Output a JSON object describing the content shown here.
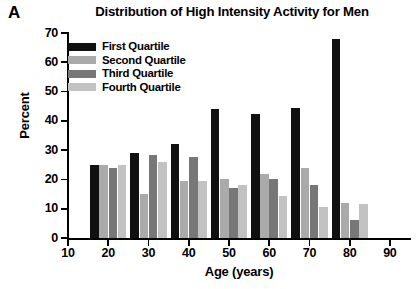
{
  "panel": {
    "label": "A"
  },
  "chart_data": {
    "type": "bar",
    "title": "Distribution of High Intensity Activity for Men",
    "xlabel": "Age (years)",
    "ylabel": "Percent",
    "ylim": [
      0,
      70
    ],
    "yticks": [
      0,
      10,
      20,
      30,
      40,
      50,
      60,
      70
    ],
    "xticks": [
      10,
      20,
      30,
      40,
      50,
      60,
      70,
      80,
      90
    ],
    "xlim": [
      10,
      95
    ],
    "grid": false,
    "legend_position": "upper-left-inside",
    "categories": [
      "20",
      "30",
      "40",
      "50",
      "60",
      "70",
      "80",
      "90"
    ],
    "series": [
      {
        "name": "First Quartile",
        "color": "#101010",
        "values": [
          25,
          29,
          32,
          44,
          42.5,
          44.5,
          68,
          0
        ]
      },
      {
        "name": "Second Quartile",
        "color": "#aaaaaa",
        "values": [
          25,
          15,
          19.5,
          20,
          22,
          24,
          12,
          0
        ]
      },
      {
        "name": "Third Quartile",
        "color": "#777777",
        "values": [
          24,
          28.5,
          27.5,
          17,
          20,
          18,
          6,
          0
        ]
      },
      {
        "name": "Fourth Quartile",
        "color": "#c2c2c2",
        "values": [
          25,
          26,
          19.5,
          18,
          14.5,
          10.5,
          11.5,
          0
        ]
      }
    ],
    "groups": [
      {
        "age": "20",
        "first": 25,
        "second": 25,
        "third": 24,
        "fourth": 25
      },
      {
        "age": "30",
        "first": 29,
        "second": 15,
        "third": 28.5,
        "fourth": 26
      },
      {
        "age": "40",
        "first": 32,
        "second": 19.5,
        "third": 27.5,
        "fourth": 19.5
      },
      {
        "age": "50",
        "first": 44,
        "second": 20,
        "third": 17,
        "fourth": 18
      },
      {
        "age": "60",
        "first": 42.5,
        "second": 22,
        "third": 20,
        "fourth": 14.5
      },
      {
        "age": "70",
        "first": 44.5,
        "second": 24,
        "third": 18,
        "fourth": 10.5
      },
      {
        "age": "80",
        "first": 68,
        "second": 12,
        "third": 6,
        "fourth": 11.5
      }
    ]
  },
  "legend": {
    "items": [
      {
        "label": "First Quartile",
        "color": "#101010"
      },
      {
        "label": "Second Quartile",
        "color": "#aaaaaa"
      },
      {
        "label": "Third Quartile",
        "color": "#777777"
      },
      {
        "label": "Fourth Quartile",
        "color": "#c2c2c2"
      }
    ]
  },
  "axis": {
    "y_tick_labels": [
      "70",
      "60",
      "50",
      "40",
      "30",
      "20",
      "10",
      "0"
    ],
    "x_tick_labels": [
      "10",
      "20",
      "30",
      "40",
      "50",
      "60",
      "70",
      "80",
      "90"
    ]
  }
}
